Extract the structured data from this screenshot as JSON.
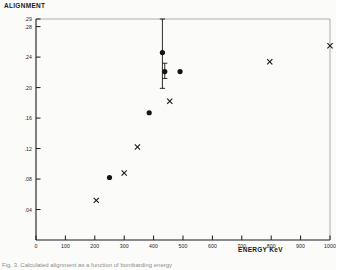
{
  "figure": {
    "background": "#fbfbfa",
    "ink_color": "#1a1a1a",
    "caption_fragment": "Fig. 3. Calculated alignment as a function of bombarding energy"
  },
  "axis_titles": {
    "y": "ALIGNMENT",
    "x": "ENERGY  KeV"
  },
  "chart_data": {
    "type": "scatter",
    "title": "",
    "subtitle": "",
    "xlabel": "ENERGY  KeV",
    "ylabel": "ALIGNMENT",
    "xlim": [
      0,
      1000
    ],
    "ylim": [
      0.0,
      0.29
    ],
    "grid": false,
    "legend": null,
    "xticks": [
      0,
      100,
      200,
      300,
      400,
      500,
      600,
      700,
      800,
      900,
      1000
    ],
    "xticklabels": [
      "0",
      "100",
      "200",
      "300",
      "400",
      "500",
      "600",
      "700",
      "800",
      "900",
      "1000"
    ],
    "yticks": [
      0.04,
      0.08,
      0.12,
      0.16,
      0.2,
      0.24,
      0.28,
      0.29
    ],
    "yticklabels": [
      ".04",
      ".08",
      ".12",
      ".16",
      ".20",
      ".24",
      ".28",
      ".29"
    ],
    "series": [
      {
        "name": "cross-markers",
        "marker": "x",
        "color": "#1a1a1a",
        "points": [
          {
            "x": 205,
            "y": 0.052
          },
          {
            "x": 300,
            "y": 0.088
          },
          {
            "x": 345,
            "y": 0.122
          },
          {
            "x": 455,
            "y": 0.182
          },
          {
            "x": 795,
            "y": 0.234
          },
          {
            "x": 1000,
            "y": 0.255
          }
        ]
      },
      {
        "name": "filled-circles",
        "marker": "o",
        "color": "#141414",
        "points": [
          {
            "x": 250,
            "y": 0.082
          },
          {
            "x": 385,
            "y": 0.167
          },
          {
            "x": 430,
            "y": 0.246,
            "yerr_low": 0.199,
            "yerr_high": 0.29
          },
          {
            "x": 438,
            "y": 0.221,
            "yerr_low": 0.212,
            "yerr_high": 0.232
          },
          {
            "x": 490,
            "y": 0.221
          }
        ]
      }
    ]
  }
}
